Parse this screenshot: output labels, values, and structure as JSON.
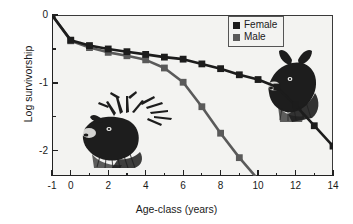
{
  "chart_data": {
    "type": "line",
    "title": "",
    "xlabel": "Age-class (years)",
    "ylabel": "Log survivorship",
    "xlim": [
      -1,
      14
    ],
    "ylim": [
      -2.37,
      0
    ],
    "grid": false,
    "legend_position": "top-right",
    "x_ticks_major": [
      -1,
      0,
      2,
      4,
      6,
      8,
      10,
      12,
      14
    ],
    "x_tick_labels": [
      "-1",
      "0",
      "2",
      "4",
      "6",
      "8",
      "10",
      "12",
      "14"
    ],
    "x_ticks_minor": [
      1,
      3,
      5,
      7,
      9,
      11,
      13
    ],
    "y_ticks_major": [
      0,
      -1,
      -2
    ],
    "y_tick_labels": [
      "0",
      "-1",
      "-2"
    ],
    "y_ticks_minor": [
      -0.5,
      -1.5
    ],
    "marker": "square",
    "series": [
      {
        "name": "Female",
        "color": "#1c1c1c",
        "x": [
          -1,
          0,
          1,
          2,
          3,
          4,
          5,
          6,
          7,
          8,
          9,
          10,
          11,
          12,
          13,
          14
        ],
        "values": [
          0,
          -0.37,
          -0.45,
          -0.5,
          -0.54,
          -0.58,
          -0.62,
          -0.65,
          -0.72,
          -0.79,
          -0.88,
          -0.95,
          -1.06,
          -1.33,
          -1.63,
          -1.93
        ]
      },
      {
        "name": "Male",
        "color": "#5a5a5a",
        "x": [
          -1,
          0,
          1,
          2,
          3,
          4,
          5,
          6,
          7,
          8,
          9,
          10
        ],
        "values": [
          0,
          -0.38,
          -0.48,
          -0.55,
          -0.6,
          -0.66,
          -0.78,
          -0.99,
          -1.35,
          -1.74,
          -2.1,
          -2.42
        ]
      }
    ],
    "annotations": [
      {
        "name": "bull-elk-illustration",
        "label": "Bull elk head with antlers"
      },
      {
        "name": "cow-elk-illustration",
        "label": "Cow elk head"
      }
    ]
  },
  "legend": {
    "entries": [
      {
        "label": "Female",
        "color": "#1c1c1c"
      },
      {
        "label": "Male",
        "color": "#5a5a5a"
      }
    ]
  }
}
